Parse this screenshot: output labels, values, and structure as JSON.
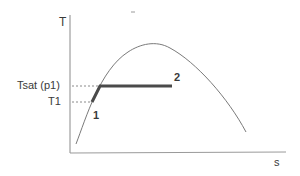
{
  "diagram": {
    "type": "T-s diagram",
    "axes": {
      "y_label": "T",
      "x_label": "s"
    },
    "labels": {
      "tsat": "Tsat (p1)",
      "t1": "T1",
      "state1": "1",
      "state2": "2"
    },
    "colors": {
      "axis": "#8a8a8a",
      "dome": "#7a7a7a",
      "process": "#4a4a4a",
      "dashed": "#8a8a8a",
      "text": "#3a3a3a"
    }
  }
}
